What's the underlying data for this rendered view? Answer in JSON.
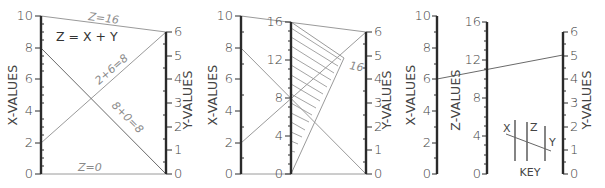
{
  "diagram": {
    "equation_label": "Z = X + Y",
    "panels": [
      {
        "id": "panel-1",
        "axes": {
          "x": {
            "label": "X-VALUES",
            "ticks": [
              "0",
              "2",
              "4",
              "6",
              "8",
              "10"
            ],
            "min": 0,
            "max": 10
          },
          "y": {
            "label": "Y-VALUES",
            "ticks": [
              "0",
              "1",
              "2",
              "3",
              "4",
              "5",
              "6"
            ],
            "min": 0,
            "max": 6
          }
        },
        "annotations": {
          "top": "Z=16",
          "bottom": "Z=0",
          "diag_up": "2+6=8",
          "diag_down": "8+0=8"
        }
      },
      {
        "id": "panel-2",
        "axes": {
          "x": {
            "label": "X-VALUES",
            "ticks": [
              "0",
              "2",
              "4",
              "6",
              "8",
              "10"
            ],
            "min": 0,
            "max": 10
          },
          "z": {
            "ticks": [
              "0",
              "4",
              "8",
              "12",
              "16"
            ],
            "min": 0,
            "max": 16
          },
          "y": {
            "label": "Y-VALUES",
            "ticks": [
              "0",
              "1",
              "2",
              "3",
              "4",
              "5",
              "6"
            ],
            "min": 0,
            "max": 6
          }
        },
        "annotations": {
          "hatch_label": "16"
        }
      },
      {
        "id": "panel-3",
        "axes": {
          "x": {
            "label": "X-VALUES",
            "ticks": [
              "0",
              "2",
              "4",
              "6",
              "8",
              "10"
            ],
            "min": 0,
            "max": 10
          },
          "z": {
            "label": "Z-VALUES",
            "ticks": [
              "0",
              "4",
              "8",
              "12",
              "16"
            ],
            "min": 0,
            "max": 16
          },
          "y": {
            "label": "Y-VALUES",
            "ticks": [
              "0",
              "1",
              "2",
              "3",
              "4",
              "5",
              "6"
            ],
            "min": 0,
            "max": 6
          }
        },
        "example": {
          "x": 6,
          "y": 5,
          "z": 11
        },
        "key": {
          "title": "KEY",
          "labels": [
            "X",
            "Z",
            "Y"
          ]
        }
      }
    ],
    "colors": {
      "axis": "#2a2a2a",
      "connector": "#9a9a9a",
      "text": "#444444"
    }
  }
}
